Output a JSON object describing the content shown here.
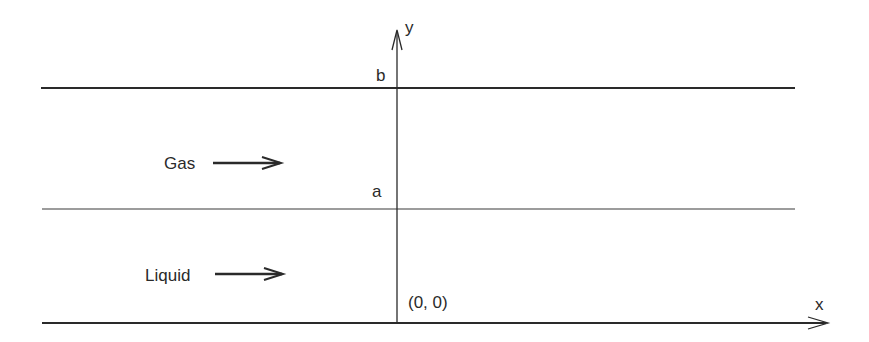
{
  "diagram": {
    "colors": {
      "line": "#2a2a2a",
      "text": "#2a2a2a",
      "background": "#ffffff"
    },
    "axes": {
      "x_label": "x",
      "y_label": "y",
      "origin_label": "(0, 0)"
    },
    "levels": {
      "b_label": "b",
      "a_label": "a"
    },
    "phases": {
      "gas_label": "Gas",
      "liquid_label": "Liquid"
    }
  }
}
